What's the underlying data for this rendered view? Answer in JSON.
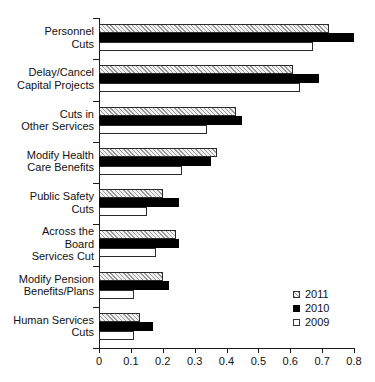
{
  "chart_data": {
    "type": "bar",
    "orientation": "horizontal",
    "title": "",
    "subtitle": "",
    "xlabel": "",
    "ylabel": "",
    "xlim": [
      0,
      0.8
    ],
    "xticks": [
      "0",
      "0.1",
      "0.2",
      "0.3",
      "0.4",
      "0.5",
      "0.6",
      "0.7",
      "0.8"
    ],
    "xtick_values": [
      0,
      0.1,
      0.2,
      0.3,
      0.4,
      0.5,
      0.6,
      0.7,
      0.8
    ],
    "grid": false,
    "legend_position": "right-lower",
    "categories": [
      "Personnel\nCuts",
      "Delay/Cancel\nCapital Projects",
      "Cuts in\nOther Services",
      "Modify Health\nCare Benefits",
      "Public Safety\nCuts",
      "Across the\nBoard\nServices Cut",
      "Modify Pension\nBenefits/Plans",
      "Human Services\nCuts"
    ],
    "series": [
      {
        "name": "2011",
        "style": "hatched",
        "values": [
          0.72,
          0.61,
          0.43,
          0.37,
          0.2,
          0.24,
          0.2,
          0.13
        ]
      },
      {
        "name": "2010",
        "style": "filled-black",
        "values": [
          0.8,
          0.69,
          0.45,
          0.35,
          0.25,
          0.25,
          0.22,
          0.17
        ]
      },
      {
        "name": "2009",
        "style": "open-white",
        "values": [
          0.67,
          0.63,
          0.34,
          0.26,
          0.15,
          0.18,
          0.11,
          0.11
        ]
      }
    ]
  },
  "legend": {
    "items": [
      {
        "label": "2011",
        "swatch": "hatched-square-icon"
      },
      {
        "label": "2010",
        "swatch": "black-square-icon"
      },
      {
        "label": "2009",
        "swatch": "white-square-icon"
      }
    ]
  },
  "colors": {
    "axis": "#1a1a1a",
    "series_2011_fill": "#f2f2f2",
    "series_2011_hatch": "#9a9a9a",
    "series_2010_fill": "#000000",
    "series_2009_fill": "#ffffff",
    "text": "#111111",
    "background": "#ffffff"
  }
}
